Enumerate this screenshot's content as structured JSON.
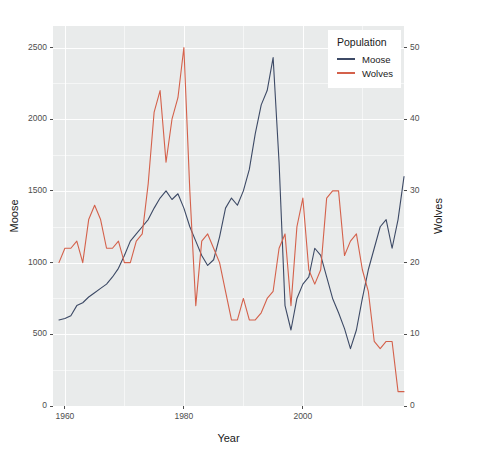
{
  "chart_data": {
    "type": "line",
    "title": "",
    "xlabel": "Year",
    "ylabel": "Moose",
    "y2label": "Wolves",
    "grid": true,
    "legend_position": "top-right",
    "legend_title": "Population",
    "xlim": [
      1958,
      2017
    ],
    "ylim": [
      0,
      2650
    ],
    "y2lim": [
      0,
      53
    ],
    "xticks": [
      1960,
      1980,
      2000
    ],
    "xminorticks": [
      1970,
      1990,
      2010
    ],
    "yticks": [
      0,
      500,
      1000,
      1500,
      2000,
      2500
    ],
    "yminorticks": [
      250,
      750,
      1250,
      1750,
      2250
    ],
    "y2ticks": [
      0,
      10,
      20,
      30,
      40,
      50
    ],
    "colors": {
      "moose": "#3d4a66",
      "wolves": "#d4614b",
      "panel": "#e9ebeb",
      "grid": "#ffffff"
    },
    "series": [
      {
        "name": "Moose",
        "axis": "left",
        "color": "#3d4a66",
        "x": [
          1959,
          1960,
          1961,
          1962,
          1963,
          1964,
          1965,
          1966,
          1967,
          1968,
          1969,
          1970,
          1971,
          1972,
          1973,
          1974,
          1975,
          1976,
          1977,
          1978,
          1979,
          1980,
          1981,
          1982,
          1983,
          1984,
          1985,
          1986,
          1987,
          1988,
          1989,
          1990,
          1991,
          1992,
          1993,
          1994,
          1995,
          1996,
          1997,
          1998,
          1999,
          2000,
          2001,
          2002,
          2003,
          2004,
          2005,
          2006,
          2007,
          2008,
          2009,
          2010,
          2011,
          2012,
          2013,
          2014,
          2015,
          2016,
          2017
        ],
        "values": [
          600,
          610,
          630,
          700,
          720,
          760,
          790,
          820,
          850,
          900,
          960,
          1050,
          1150,
          1200,
          1250,
          1300,
          1380,
          1450,
          1500,
          1440,
          1480,
          1380,
          1250,
          1150,
          1050,
          980,
          1020,
          1180,
          1380,
          1450,
          1400,
          1500,
          1650,
          1900,
          2100,
          2200,
          2430,
          1700,
          700,
          530,
          750,
          850,
          900,
          1100,
          1050,
          900,
          750,
          650,
          540,
          400,
          530,
          750,
          950,
          1100,
          1250,
          1300,
          1100,
          1300,
          1600
        ]
      },
      {
        "name": "Wolves",
        "axis": "right",
        "color": "#d4614b",
        "x": [
          1959,
          1960,
          1961,
          1962,
          1963,
          1964,
          1965,
          1966,
          1967,
          1968,
          1969,
          1970,
          1971,
          1972,
          1973,
          1974,
          1975,
          1976,
          1977,
          1978,
          1979,
          1980,
          1981,
          1982,
          1983,
          1984,
          1985,
          1986,
          1987,
          1988,
          1989,
          1990,
          1991,
          1992,
          1993,
          1994,
          1995,
          1996,
          1997,
          1998,
          1999,
          2000,
          2001,
          2002,
          2003,
          2004,
          2005,
          2006,
          2007,
          2008,
          2009,
          2010,
          2011,
          2012,
          2013,
          2014,
          2015,
          2016,
          2017
        ],
        "values": [
          20,
          22,
          22,
          23,
          20,
          26,
          28,
          26,
          22,
          22,
          23,
          20,
          20,
          23,
          24,
          31,
          41,
          44,
          34,
          40,
          43,
          50,
          30,
          14,
          23,
          24,
          22,
          20,
          16,
          12,
          12,
          15,
          12,
          12,
          13,
          15,
          16,
          22,
          24,
          14,
          25,
          29,
          19,
          17,
          19,
          29,
          30,
          30,
          21,
          23,
          24,
          19,
          16,
          9,
          8,
          9,
          9,
          2,
          2
        ]
      }
    ]
  },
  "axes": {
    "x": {
      "title": "Year",
      "tick_labels": [
        "1960",
        "1980",
        "2000"
      ]
    },
    "y_left": {
      "title": "Moose",
      "tick_labels": [
        "0",
        "500",
        "1000",
        "1500",
        "2000",
        "2500"
      ]
    },
    "y_right": {
      "title": "Wolves",
      "tick_labels": [
        "0",
        "10",
        "20",
        "30",
        "40",
        "50"
      ]
    }
  },
  "legend": {
    "title": "Population",
    "items": [
      {
        "label": "Moose",
        "color": "#3d4a66"
      },
      {
        "label": "Wolves",
        "color": "#d4614b"
      }
    ]
  }
}
